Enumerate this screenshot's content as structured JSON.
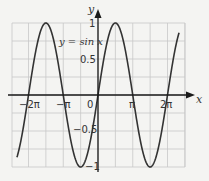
{
  "chart_data": {
    "type": "line",
    "title": "",
    "function_label": "y = sin x",
    "xlabel": "x",
    "ylabel": "y",
    "xlim": [
      -7.33,
      7.33
    ],
    "ylim": [
      -1,
      1
    ],
    "grid": true,
    "x_ticks": [
      {
        "value": -6.283,
        "label": "−2π"
      },
      {
        "value": -3.1416,
        "label": "−π"
      },
      {
        "value": 3.1416,
        "label": "π"
      },
      {
        "value": 6.283,
        "label": "2π"
      }
    ],
    "origin_label": "0",
    "y_ticks": [
      {
        "value": 1,
        "label": "1"
      },
      {
        "value": 0.5,
        "label": "0.5"
      },
      {
        "value": -0.5,
        "label": "−0.5"
      },
      {
        "value": -1,
        "label": "−1"
      }
    ],
    "series": [
      {
        "name": "y = sin x",
        "function": "sin",
        "x_range": [
          -7.33,
          7.33
        ]
      }
    ],
    "colors": {
      "background": "#f4f4f2",
      "grid": "#c8c8c8",
      "curve": "#333333",
      "axis": "#1a1a1a"
    }
  }
}
